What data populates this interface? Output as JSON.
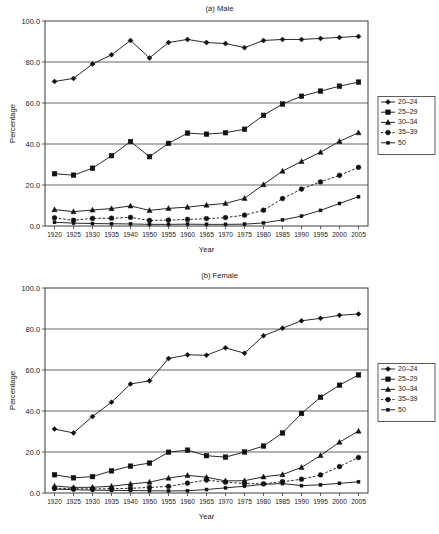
{
  "figure": {
    "background": "#ffffff",
    "ink_color": "#111111",
    "grid_color": "#555555"
  },
  "chart_data": [
    {
      "type": "line",
      "title": "(a) Male",
      "xlabel": "Year",
      "ylabel": "Percentage",
      "ylim": [
        0.0,
        100.0
      ],
      "yticks": [
        "0.0",
        "20.0",
        "40.0",
        "60.0",
        "80.0",
        "100.0"
      ],
      "ytick_values": [
        0,
        20,
        40,
        60,
        80,
        100
      ],
      "grid": true,
      "grid_axis": "y",
      "legend_position": "right",
      "categories": [
        "1920",
        "1925",
        "1930",
        "1935",
        "1940",
        "1950",
        "1955",
        "1960",
        "1965",
        "1970",
        "1975",
        "1980",
        "1985",
        "1990",
        "1995",
        "2000",
        "2005"
      ],
      "series": [
        {
          "name": "20–24",
          "marker": "diamond",
          "linestyle": "solid",
          "values": [
            70.5,
            72.0,
            79.0,
            83.5,
            90.5,
            82.0,
            89.5,
            91.0,
            89.5,
            89.0,
            87.0,
            90.5,
            91.0,
            91.0,
            91.5,
            92.0,
            92.5
          ]
        },
        {
          "name": "25–29",
          "marker": "square",
          "linestyle": "solid",
          "values": [
            25.5,
            24.8,
            28.2,
            34.3,
            41.2,
            33.8,
            40.3,
            45.3,
            44.8,
            45.5,
            47.2,
            54.0,
            59.5,
            63.3,
            65.8,
            68.2,
            70.2
          ]
        },
        {
          "name": "30–34",
          "marker": "triangle",
          "linestyle": "solid",
          "values": [
            8.0,
            7.0,
            7.8,
            8.5,
            9.8,
            7.6,
            8.6,
            9.2,
            10.2,
            11.0,
            13.5,
            20.2,
            26.8,
            31.5,
            36.0,
            41.3,
            45.5
          ]
        },
        {
          "name": "35–39",
          "marker": "circle",
          "linestyle": "dashed",
          "values": [
            4.0,
            2.8,
            3.7,
            3.8,
            4.2,
            2.7,
            2.9,
            3.2,
            3.6,
            4.1,
            5.3,
            7.7,
            13.4,
            18.0,
            21.5,
            24.7,
            28.6
          ]
        },
        {
          "name": "50",
          "marker": "square-small",
          "linestyle": "solid",
          "values": [
            1.8,
            1.4,
            1.2,
            1.1,
            1.0,
            0.8,
            0.8,
            0.9,
            0.8,
            0.8,
            0.9,
            1.5,
            3.0,
            4.8,
            7.6,
            11.0,
            14.3
          ]
        }
      ]
    },
    {
      "type": "line",
      "title": "(b) Female",
      "xlabel": "Year",
      "ylabel": "Percentage",
      "ylim": [
        0.0,
        100.0
      ],
      "yticks": [
        "0.0",
        "20.0",
        "40.0",
        "60.0",
        "80.0",
        "100.0"
      ],
      "ytick_values": [
        0,
        20,
        40,
        60,
        80,
        100
      ],
      "grid": true,
      "grid_axis": "y",
      "legend_position": "right",
      "categories": [
        "1920",
        "1925",
        "1930",
        "1935",
        "1940",
        "1950",
        "1955",
        "1960",
        "1965",
        "1970",
        "1975",
        "1980",
        "1985",
        "1990",
        "1995",
        "2000",
        "2005"
      ],
      "series": [
        {
          "name": "20–24",
          "marker": "diamond",
          "linestyle": "solid",
          "values": [
            31.2,
            29.3,
            37.3,
            44.3,
            53.2,
            54.7,
            65.6,
            67.4,
            67.2,
            70.8,
            68.2,
            76.7,
            80.4,
            84.0,
            85.2,
            86.7,
            87.3
          ]
        },
        {
          "name": "25–29",
          "marker": "square",
          "linestyle": "solid",
          "values": [
            8.9,
            7.4,
            8.0,
            10.8,
            13.1,
            14.6,
            19.9,
            20.9,
            18.2,
            17.5,
            20.0,
            22.9,
            29.3,
            38.8,
            46.7,
            52.6,
            57.6
          ]
        },
        {
          "name": "30–34",
          "marker": "triangle",
          "linestyle": "solid",
          "values": [
            3.4,
            2.7,
            2.8,
            3.3,
            4.4,
            5.3,
            7.3,
            8.6,
            7.7,
            5.9,
            6.0,
            7.9,
            9.0,
            12.5,
            18.3,
            24.8,
            30.2
          ]
        },
        {
          "name": "35–39",
          "marker": "circle",
          "linestyle": "dashed",
          "values": [
            2.3,
            2.1,
            2.0,
            2.1,
            2.3,
            2.7,
            3.2,
            4.8,
            6.3,
            5.3,
            4.6,
            4.5,
            5.5,
            6.7,
            8.8,
            12.9,
            17.3
          ]
        },
        {
          "name": "50",
          "marker": "square-small",
          "linestyle": "solid",
          "values": [
            1.9,
            1.6,
            1.4,
            1.3,
            1.2,
            1.1,
            1.0,
            1.1,
            1.7,
            2.5,
            3.3,
            4.2,
            4.6,
            3.6,
            4.0,
            4.7,
            5.5
          ]
        }
      ]
    }
  ]
}
